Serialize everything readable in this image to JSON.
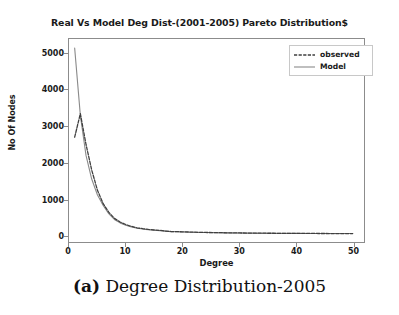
{
  "chart_data": {
    "type": "line",
    "title": "Real Vs Model Deg Dist-(2001-2005) Pareto Distribution$",
    "xlabel": "Degree",
    "ylabel": "No Of Nodes",
    "xlim": [
      0,
      52
    ],
    "ylim": [
      -180,
      5400
    ],
    "grid": false,
    "legend_position": "upper right",
    "xticks": [
      0,
      10,
      20,
      30,
      40,
      50
    ],
    "xtick_labels": [
      "0",
      "10",
      "20",
      "30",
      "40",
      "50"
    ],
    "yticks": [
      0,
      1000,
      2000,
      3000,
      4000,
      5000
    ],
    "ytick_labels": [
      "0",
      "1000",
      "2000",
      "3000",
      "4000",
      "5000"
    ],
    "x": [
      1,
      2,
      3,
      4,
      5,
      6,
      7,
      8,
      9,
      10,
      11,
      12,
      13,
      14,
      15,
      16,
      17,
      18,
      19,
      20,
      22,
      24,
      26,
      28,
      30,
      32,
      34,
      36,
      38,
      40,
      42,
      44,
      46,
      48,
      50
    ],
    "series": [
      {
        "name": "observed",
        "style": "dashed",
        "color": "#3f3f3f",
        "values": [
          2700,
          3350,
          2500,
          1800,
          1250,
          880,
          640,
          470,
          370,
          300,
          250,
          210,
          185,
          165,
          150,
          140,
          120,
          108,
          105,
          100,
          90,
          82,
          78,
          72,
          68,
          65,
          62,
          60,
          58,
          56,
          55,
          54,
          53,
          52,
          52
        ]
      },
      {
        "name": "Model",
        "style": "solid",
        "color": "#8a8a8a",
        "values": [
          5150,
          3300,
          2200,
          1550,
          1120,
          830,
          600,
          440,
          345,
          280,
          235,
          200,
          175,
          158,
          145,
          132,
          118,
          106,
          100,
          96,
          88,
          80,
          76,
          71,
          67,
          64,
          61,
          59,
          57,
          56,
          55,
          54,
          53,
          52,
          52
        ]
      }
    ]
  },
  "legend": {
    "items": [
      {
        "label": "observed"
      },
      {
        "label": "Model"
      }
    ]
  },
  "caption": {
    "tag": "(a)",
    "text": " Degree Distribution-2005"
  },
  "colors": {
    "axis": "#8c8c8c",
    "text": "#1a1a1a",
    "observed": "#3f3f3f",
    "model": "#8a8a8a",
    "background": "#ffffff"
  }
}
